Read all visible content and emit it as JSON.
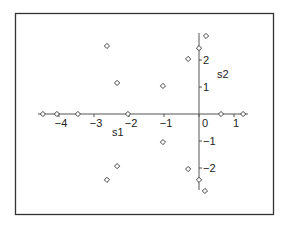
{
  "chart_data": {
    "type": "scatter",
    "title": "",
    "xlabel": "s1",
    "ylabel": "s2",
    "xlim": [
      -4.6,
      1.4
    ],
    "ylim": [
      -3.0,
      3.0
    ],
    "grid": false,
    "legend": null,
    "axes_style": "crossing-at-origin",
    "x_ticks": [
      -4,
      -3,
      -2,
      -1,
      0,
      1
    ],
    "x_tick_labels": [
      "−4",
      "−3",
      "−2",
      "−1",
      "0",
      "1"
    ],
    "y_ticks": [
      -2,
      -1,
      1,
      2
    ],
    "y_tick_labels": [
      "−2",
      "−1",
      "1",
      "2"
    ],
    "marker": "diamond-open",
    "series": [
      {
        "name": "points",
        "points": [
          {
            "x": -4.46,
            "y": 0.0
          },
          {
            "x": -4.06,
            "y": 0.0
          },
          {
            "x": -3.46,
            "y": 0.0
          },
          {
            "x": -2.03,
            "y": 0.0
          },
          {
            "x": 0.63,
            "y": 0.0
          },
          {
            "x": 1.26,
            "y": 0.0
          },
          {
            "x": -2.63,
            "y": 2.52
          },
          {
            "x": -2.34,
            "y": 1.15
          },
          {
            "x": -2.34,
            "y": -1.93
          },
          {
            "x": -2.63,
            "y": -2.44
          },
          {
            "x": -1.03,
            "y": 1.04
          },
          {
            "x": -1.03,
            "y": -1.04
          },
          {
            "x": -0.31,
            "y": 2.04
          },
          {
            "x": -0.31,
            "y": -2.04
          },
          {
            "x": 0.0,
            "y": 2.44
          },
          {
            "x": 0.0,
            "y": -2.44
          },
          {
            "x": 0.2,
            "y": 2.89
          },
          {
            "x": 0.17,
            "y": -2.85
          }
        ]
      }
    ]
  },
  "colors": {
    "frame": "#333333",
    "axis": "#555555",
    "marker": "#444444",
    "background": "#ffffff"
  }
}
